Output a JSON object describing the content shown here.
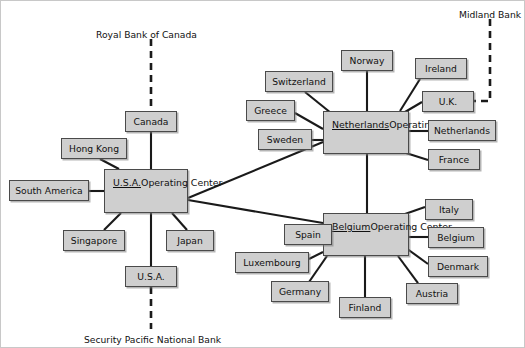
{
  "diagram": {
    "colors": {
      "node_fill": "#cfcfcf",
      "node_border": "#4a4a4a",
      "line": "#1a1a1a",
      "background": "#ffffff"
    },
    "external_labels": [
      {
        "id": "royal-bank-of-canada",
        "text": "Royal Bank of Canada",
        "x": 95,
        "y": 28
      },
      {
        "id": "midland-bank",
        "text": "Midland Bank",
        "x": 458,
        "y": 8
      },
      {
        "id": "security-pacific-national-bank",
        "text": "Security Pacific National Bank",
        "x": 83,
        "y": 333
      }
    ],
    "centers": [
      {
        "id": "usa-operating-center",
        "name": "U.S.A.",
        "subtitle": "Operating Center",
        "x": 103,
        "y": 168,
        "w": 84,
        "h": 44
      },
      {
        "id": "netherlands-operating-center",
        "name": "Netherlands",
        "subtitle": "Operating Center",
        "x": 322,
        "y": 110,
        "w": 86,
        "h": 43
      },
      {
        "id": "belgium-operating-center",
        "name": "Belgium",
        "subtitle": "Operating Center",
        "x": 322,
        "y": 212,
        "w": 86,
        "h": 43
      }
    ],
    "nodes": [
      {
        "id": "canada",
        "label": "Canada",
        "x": 124,
        "y": 110,
        "w": 52,
        "h": 21
      },
      {
        "id": "hong-kong",
        "label": "Hong Kong",
        "x": 60,
        "y": 137,
        "w": 66,
        "h": 21
      },
      {
        "id": "south-america",
        "label": "South America",
        "x": 8,
        "y": 179,
        "w": 80,
        "h": 21
      },
      {
        "id": "singapore",
        "label": "Singapore",
        "x": 62,
        "y": 229,
        "w": 62,
        "h": 21
      },
      {
        "id": "japan",
        "label": "Japan",
        "x": 165,
        "y": 229,
        "w": 48,
        "h": 21
      },
      {
        "id": "usa",
        "label": "U.S.A.",
        "x": 124,
        "y": 265,
        "w": 52,
        "h": 21
      },
      {
        "id": "norway",
        "label": "Norway",
        "x": 340,
        "y": 49,
        "w": 52,
        "h": 21
      },
      {
        "id": "switzerland",
        "label": "Switzerland",
        "x": 264,
        "y": 70,
        "w": 68,
        "h": 21
      },
      {
        "id": "greece",
        "label": "Greece",
        "x": 245,
        "y": 99,
        "w": 49,
        "h": 21
      },
      {
        "id": "sweden",
        "label": "Sweden",
        "x": 257,
        "y": 128,
        "w": 54,
        "h": 21
      },
      {
        "id": "ireland",
        "label": "Ireland",
        "x": 414,
        "y": 57,
        "w": 52,
        "h": 21
      },
      {
        "id": "uk",
        "label": "U.K.",
        "x": 421,
        "y": 90,
        "w": 52,
        "h": 21
      },
      {
        "id": "netherlands",
        "label": "Netherlands",
        "x": 427,
        "y": 119,
        "w": 68,
        "h": 21
      },
      {
        "id": "france",
        "label": "France",
        "x": 427,
        "y": 148,
        "w": 52,
        "h": 21
      },
      {
        "id": "italy",
        "label": "Italy",
        "x": 424,
        "y": 198,
        "w": 48,
        "h": 21
      },
      {
        "id": "belgium",
        "label": "Belgium",
        "x": 427,
        "y": 226,
        "w": 56,
        "h": 21
      },
      {
        "id": "denmark",
        "label": "Denmark",
        "x": 427,
        "y": 255,
        "w": 60,
        "h": 21
      },
      {
        "id": "austria",
        "label": "Austria",
        "x": 405,
        "y": 282,
        "w": 52,
        "h": 21
      },
      {
        "id": "spain",
        "label": "Spain",
        "x": 283,
        "y": 223,
        "w": 48,
        "h": 21
      },
      {
        "id": "luxembourg",
        "label": "Luxembourg",
        "x": 234,
        "y": 251,
        "w": 74,
        "h": 21
      },
      {
        "id": "germany",
        "label": "Germany",
        "x": 270,
        "y": 280,
        "w": 58,
        "h": 21
      },
      {
        "id": "finland",
        "label": "Finland",
        "x": 338,
        "y": 296,
        "w": 52,
        "h": 21
      }
    ],
    "links": [
      {
        "id": "link-usa-canada",
        "from": "usa-operating-center",
        "to": "canada",
        "x1": 150,
        "y1": 168,
        "x2": 150,
        "y2": 131
      },
      {
        "id": "link-usa-hong-kong",
        "from": "usa-operating-center",
        "to": "hong-kong",
        "x1": 118,
        "y1": 168,
        "x2": 99,
        "y2": 158
      },
      {
        "id": "link-usa-south-america",
        "from": "usa-operating-center",
        "to": "south-america",
        "x1": 103,
        "y1": 190,
        "x2": 88,
        "y2": 190
      },
      {
        "id": "link-usa-singapore",
        "from": "usa-operating-center",
        "to": "singapore",
        "x1": 120,
        "y1": 212,
        "x2": 103,
        "y2": 229
      },
      {
        "id": "link-usa-japan",
        "from": "usa-operating-center",
        "to": "japan",
        "x1": 171,
        "y1": 212,
        "x2": 186,
        "y2": 229
      },
      {
        "id": "link-usa-usa",
        "from": "usa-operating-center",
        "to": "usa",
        "x1": 150,
        "y1": 212,
        "x2": 150,
        "y2": 265
      },
      {
        "id": "link-usa-netherlands-center",
        "from": "usa-operating-center",
        "to": "netherlands-operating-center",
        "x1": 187,
        "y1": 197,
        "x2": 322,
        "y2": 141
      },
      {
        "id": "link-usa-belgium-center",
        "from": "usa-operating-center",
        "to": "belgium-operating-center",
        "x1": 187,
        "y1": 199,
        "x2": 322,
        "y2": 222
      },
      {
        "id": "link-nl-norway",
        "from": "netherlands-operating-center",
        "to": "norway",
        "x1": 366,
        "y1": 110,
        "x2": 366,
        "y2": 70
      },
      {
        "id": "link-nl-switzerland",
        "from": "netherlands-operating-center",
        "to": "switzerland",
        "x1": 330,
        "y1": 112,
        "x2": 304,
        "y2": 91
      },
      {
        "id": "link-nl-greece",
        "from": "netherlands-operating-center",
        "to": "greece",
        "x1": 322,
        "y1": 128,
        "x2": 294,
        "y2": 112
      },
      {
        "id": "link-nl-sweden",
        "from": "netherlands-operating-center",
        "to": "sweden",
        "x1": 322,
        "y1": 139,
        "x2": 311,
        "y2": 139
      },
      {
        "id": "link-nl-ireland",
        "from": "netherlands-operating-center",
        "to": "ireland",
        "x1": 399,
        "y1": 110,
        "x2": 419,
        "y2": 78
      },
      {
        "id": "link-nl-uk",
        "from": "netherlands-operating-center",
        "to": "uk",
        "x1": 404,
        "y1": 111,
        "x2": 421,
        "y2": 101
      },
      {
        "id": "link-nl-netherlands",
        "from": "netherlands-operating-center",
        "to": "netherlands",
        "x1": 408,
        "y1": 130,
        "x2": 427,
        "y2": 130
      },
      {
        "id": "link-nl-france",
        "from": "netherlands-operating-center",
        "to": "france",
        "x1": 405,
        "y1": 152,
        "x2": 427,
        "y2": 159
      },
      {
        "id": "link-be-italy",
        "from": "belgium-operating-center",
        "to": "italy",
        "x1": 404,
        "y1": 213,
        "x2": 424,
        "y2": 206
      },
      {
        "id": "link-be-belgium",
        "from": "belgium-operating-center",
        "to": "belgium",
        "x1": 408,
        "y1": 236,
        "x2": 427,
        "y2": 236
      },
      {
        "id": "link-be-denmark",
        "from": "belgium-operating-center",
        "to": "denmark",
        "x1": 405,
        "y1": 247,
        "x2": 427,
        "y2": 263
      },
      {
        "id": "link-be-austria",
        "from": "belgium-operating-center",
        "to": "austria",
        "x1": 397,
        "y1": 255,
        "x2": 417,
        "y2": 282
      },
      {
        "id": "link-be-finland",
        "from": "belgium-operating-center",
        "to": "finland",
        "x1": 364,
        "y1": 255,
        "x2": 364,
        "y2": 296
      },
      {
        "id": "link-be-spain",
        "from": "belgium-operating-center",
        "to": "spain",
        "x1": 322,
        "y1": 233,
        "x2": 331,
        "y2": 233
      },
      {
        "id": "link-be-luxembourg",
        "from": "belgium-operating-center",
        "to": "luxembourg",
        "x1": 322,
        "y1": 251,
        "x2": 308,
        "y2": 258
      },
      {
        "id": "link-be-germany",
        "from": "belgium-operating-center",
        "to": "germany",
        "x1": 326,
        "y1": 255,
        "x2": 308,
        "y2": 281
      },
      {
        "id": "link-nl-belgium-center",
        "from": "netherlands-operating-center",
        "to": "belgium-operating-center",
        "x1": 366,
        "y1": 153,
        "x2": 366,
        "y2": 212
      }
    ],
    "dashed_links": [
      {
        "id": "dash-royal-bank-to-canada",
        "label_ref": "royal-bank-of-canada",
        "points": "150,38 150,110"
      },
      {
        "id": "dash-usa-to-security-pacific",
        "label_ref": "security-pacific-national-bank",
        "points": "150,286 150,328"
      },
      {
        "id": "dash-midland-to-uk",
        "label_ref": "midland-bank",
        "points": "489,18 489,100 473,100"
      }
    ]
  }
}
